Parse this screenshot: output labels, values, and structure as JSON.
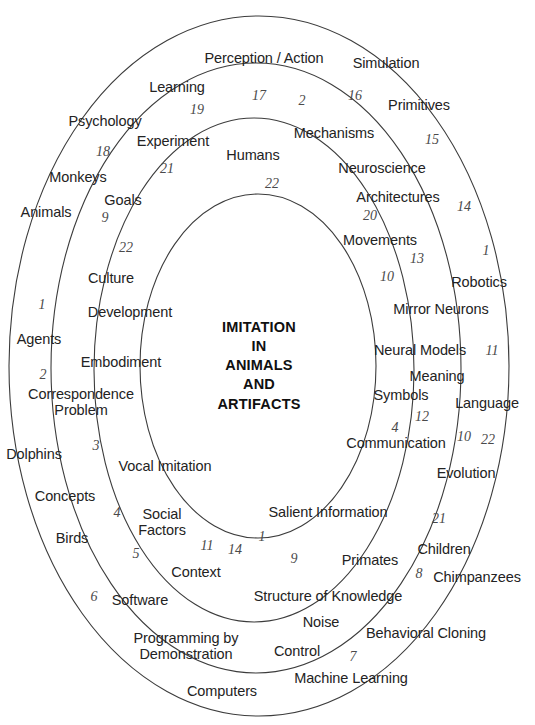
{
  "figure": {
    "type": "concentric-ellipse-concept-map",
    "center_title": "IMITATION\nIN\nANIMALS\nAND\nARTIFACTS",
    "background_color": "#ffffff",
    "ring_stroke_color": "#3c3c3c",
    "label_color": "#232323",
    "number_color": "#4a4a4a",
    "ring_count": 4
  },
  "rings": [
    {
      "name": "outer-ring",
      "cx": 259,
      "cy": 366,
      "rx": 250,
      "ry": 350
    },
    {
      "name": "second-ring",
      "cx": 256,
      "cy": 368,
      "rx": 205,
      "ry": 305
    },
    {
      "name": "third-ring",
      "cx": 254,
      "cy": 370,
      "rx": 160,
      "ry": 252
    },
    {
      "name": "inner-ring",
      "cx": 258,
      "cy": 366,
      "rx": 118,
      "ry": 172
    }
  ],
  "labels": [
    {
      "text": "Perception / Action",
      "x": 264,
      "y": 59
    },
    {
      "text": "Simulation",
      "x": 386,
      "y": 64
    },
    {
      "text": "Learning",
      "x": 177,
      "y": 88
    },
    {
      "text": "Primitives",
      "x": 419,
      "y": 106
    },
    {
      "text": "Psychology",
      "x": 105,
      "y": 122
    },
    {
      "text": "Mechanisms",
      "x": 334,
      "y": 134
    },
    {
      "text": "Experiment",
      "x": 173,
      "y": 142
    },
    {
      "text": "Humans",
      "x": 253,
      "y": 156
    },
    {
      "text": "Neuroscience",
      "x": 382,
      "y": 169
    },
    {
      "text": "Monkeys",
      "x": 78,
      "y": 178
    },
    {
      "text": "Architectures",
      "x": 398,
      "y": 198
    },
    {
      "text": "Goals",
      "x": 123,
      "y": 201
    },
    {
      "text": "Animals",
      "x": 46,
      "y": 213
    },
    {
      "text": "Movements",
      "x": 380,
      "y": 241
    },
    {
      "text": "Robotics",
      "x": 479,
      "y": 283
    },
    {
      "text": "Culture",
      "x": 111,
      "y": 279
    },
    {
      "text": "Mirror Neurons",
      "x": 441,
      "y": 310
    },
    {
      "text": "Development",
      "x": 130,
      "y": 313
    },
    {
      "text": "Agents",
      "x": 39,
      "y": 340
    },
    {
      "text": "Neural Models",
      "x": 420,
      "y": 351
    },
    {
      "text": "Embodiment",
      "x": 121,
      "y": 363
    },
    {
      "text": "Meaning",
      "x": 437,
      "y": 377
    },
    {
      "text": "Symbols",
      "x": 401,
      "y": 396
    },
    {
      "text": "Language",
      "x": 487,
      "y": 404
    },
    {
      "text": "Correspondence\nProblem",
      "x": 81,
      "y": 402
    },
    {
      "text": "Communication",
      "x": 396,
      "y": 444
    },
    {
      "text": "Dolphins",
      "x": 34,
      "y": 455
    },
    {
      "text": "Evolution",
      "x": 466,
      "y": 474
    },
    {
      "text": "Vocal Imitation",
      "x": 165,
      "y": 467
    },
    {
      "text": "Concepts",
      "x": 65,
      "y": 497
    },
    {
      "text": "Salient Information",
      "x": 328,
      "y": 513
    },
    {
      "text": "Social\nFactors",
      "x": 162,
      "y": 522
    },
    {
      "text": "Birds",
      "x": 72,
      "y": 539
    },
    {
      "text": "Primates",
      "x": 370,
      "y": 561
    },
    {
      "text": "Children",
      "x": 444,
      "y": 550
    },
    {
      "text": "Context",
      "x": 196,
      "y": 573
    },
    {
      "text": "Chimpanzees",
      "x": 477,
      "y": 578
    },
    {
      "text": "Structure of Knowledge",
      "x": 328,
      "y": 597
    },
    {
      "text": "Software",
      "x": 140,
      "y": 601
    },
    {
      "text": "Noise",
      "x": 321,
      "y": 623
    },
    {
      "text": "Behavioral Cloning",
      "x": 426,
      "y": 634
    },
    {
      "text": "Programming by\nDemonstration",
      "x": 186,
      "y": 646
    },
    {
      "text": "Control",
      "x": 297,
      "y": 652
    },
    {
      "text": "Machine Learning",
      "x": 351,
      "y": 679
    },
    {
      "text": "Computers",
      "x": 222,
      "y": 692
    }
  ],
  "numbers": [
    {
      "text": "17",
      "x": 259,
      "y": 96
    },
    {
      "text": "2",
      "x": 302,
      "y": 101
    },
    {
      "text": "16",
      "x": 355,
      "y": 96
    },
    {
      "text": "19",
      "x": 197,
      "y": 110
    },
    {
      "text": "15",
      "x": 432,
      "y": 140
    },
    {
      "text": "18",
      "x": 103,
      "y": 152
    },
    {
      "text": "21",
      "x": 167,
      "y": 169
    },
    {
      "text": "22",
      "x": 272,
      "y": 184
    },
    {
      "text": "20",
      "x": 370,
      "y": 216
    },
    {
      "text": "14",
      "x": 464,
      "y": 207
    },
    {
      "text": "9",
      "x": 105,
      "y": 218
    },
    {
      "text": "13",
      "x": 417,
      "y": 259
    },
    {
      "text": "1",
      "x": 486,
      "y": 251
    },
    {
      "text": "10",
      "x": 387,
      "y": 277
    },
    {
      "text": "22",
      "x": 126,
      "y": 248
    },
    {
      "text": "1",
      "x": 42,
      "y": 305
    },
    {
      "text": "11",
      "x": 492,
      "y": 351
    },
    {
      "text": "2",
      "x": 43,
      "y": 375
    },
    {
      "text": "12",
      "x": 422,
      "y": 417
    },
    {
      "text": "4",
      "x": 395,
      "y": 428
    },
    {
      "text": "10",
      "x": 464,
      "y": 437
    },
    {
      "text": "22",
      "x": 488,
      "y": 440
    },
    {
      "text": "3",
      "x": 96,
      "y": 446
    },
    {
      "text": "21",
      "x": 439,
      "y": 519
    },
    {
      "text": "4",
      "x": 117,
      "y": 513
    },
    {
      "text": "1",
      "x": 262,
      "y": 537
    },
    {
      "text": "11",
      "x": 207,
      "y": 546
    },
    {
      "text": "14",
      "x": 235,
      "y": 550
    },
    {
      "text": "9",
      "x": 294,
      "y": 559
    },
    {
      "text": "5",
      "x": 136,
      "y": 554
    },
    {
      "text": "8",
      "x": 419,
      "y": 574
    },
    {
      "text": "6",
      "x": 94,
      "y": 597
    },
    {
      "text": "7",
      "x": 353,
      "y": 657
    }
  ]
}
